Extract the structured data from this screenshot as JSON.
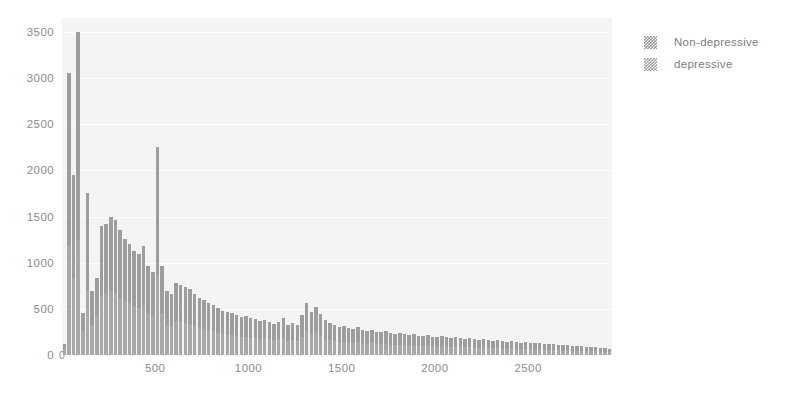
{
  "chart_data": {
    "type": "bar",
    "title": "",
    "subtitle": "",
    "xlabel": "",
    "ylabel": "",
    "xlim": [
      0,
      2950
    ],
    "ylim": [
      0,
      3650
    ],
    "grid": true,
    "legend_position": "right",
    "colors": {
      "series_non_depressive": "#9d9d9d",
      "series_depressive": "#a8a8a8",
      "plot_background": "#f4f4f4",
      "gridline": "#fdfdfd",
      "axis_text": "#8c8c8c",
      "legend_text": "#7d7d7d"
    },
    "y_ticks": [
      0,
      500,
      1000,
      1500,
      2000,
      2500,
      3000,
      3500
    ],
    "y_tick_labels": [
      "0",
      "500",
      "1000",
      "1500",
      "2000",
      "2500",
      "3000",
      "3500"
    ],
    "x_ticks": [
      0,
      500,
      1000,
      1500,
      2000,
      2500
    ],
    "x_tick_labels": [
      "0",
      "500",
      "1000",
      "1500",
      "2000",
      "2500"
    ],
    "legend": [
      {
        "label": "Non-depressive",
        "color": "#9d9d9d"
      },
      {
        "label": "depressive",
        "color": "#a8a8a8"
      }
    ],
    "bin_width": 25,
    "x": [
      12,
      37,
      62,
      87,
      112,
      137,
      162,
      187,
      212,
      237,
      262,
      287,
      312,
      337,
      362,
      387,
      412,
      437,
      462,
      487,
      512,
      537,
      562,
      587,
      612,
      637,
      662,
      687,
      712,
      737,
      762,
      787,
      812,
      837,
      862,
      887,
      912,
      937,
      962,
      987,
      1012,
      1037,
      1062,
      1087,
      1112,
      1137,
      1162,
      1187,
      1212,
      1237,
      1262,
      1287,
      1312,
      1337,
      1362,
      1387,
      1412,
      1437,
      1462,
      1487,
      1512,
      1537,
      1562,
      1587,
      1612,
      1637,
      1662,
      1687,
      1712,
      1737,
      1762,
      1787,
      1812,
      1837,
      1862,
      1887,
      1912,
      1937,
      1962,
      1987,
      2012,
      2037,
      2062,
      2087,
      2112,
      2137,
      2162,
      2187,
      2212,
      2237,
      2262,
      2287,
      2312,
      2337,
      2362,
      2387,
      2412,
      2437,
      2462,
      2487,
      2512,
      2537,
      2562,
      2587,
      2612,
      2637,
      2662,
      2687,
      2712,
      2737,
      2762,
      2787,
      2812,
      2837,
      2862,
      2887,
      2912,
      2937
    ],
    "series": [
      {
        "name": "Non-depressive",
        "values": [
          120,
          3050,
          1950,
          3500,
          450,
          1750,
          690,
          830,
          1400,
          1420,
          1500,
          1460,
          1350,
          1260,
          1200,
          1130,
          1090,
          1180,
          960,
          900,
          2250,
          960,
          690,
          660,
          780,
          760,
          740,
          710,
          660,
          620,
          600,
          560,
          540,
          510,
          480,
          470,
          450,
          430,
          410,
          420,
          400,
          390,
          370,
          380,
          360,
          340,
          360,
          400,
          330,
          350,
          320,
          430,
          560,
          470,
          520,
          440,
          380,
          350,
          330,
          300,
          310,
          290,
          280,
          300,
          270,
          260,
          275,
          250,
          245,
          260,
          235,
          230,
          240,
          225,
          215,
          230,
          210,
          205,
          215,
          200,
          195,
          205,
          190,
          185,
          195,
          180,
          175,
          185,
          170,
          165,
          175,
          160,
          155,
          165,
          150,
          145,
          155,
          140,
          135,
          145,
          130,
          125,
          135,
          120,
          115,
          120,
          110,
          105,
          110,
          100,
          95,
          100,
          90,
          85,
          88,
          80,
          75,
          70
        ]
      },
      {
        "name": "depressive",
        "values": [
          70,
          1180,
          830,
          1250,
          260,
          700,
          330,
          420,
          640,
          660,
          690,
          670,
          620,
          580,
          560,
          530,
          510,
          545,
          450,
          420,
          880,
          450,
          330,
          310,
          365,
          355,
          345,
          335,
          310,
          290,
          280,
          265,
          255,
          240,
          225,
          220,
          212,
          202,
          195,
          198,
          188,
          183,
          175,
          178,
          170,
          160,
          170,
          188,
          155,
          165,
          150,
          200,
          260,
          220,
          245,
          205,
          178,
          165,
          155,
          142,
          146,
          136,
          132,
          142,
          128,
          122,
          130,
          118,
          115,
          122,
          110,
          108,
          113,
          106,
          101,
          108,
          99,
          96,
          101,
          94,
          92,
          96,
          89,
          87,
          92,
          85,
          82,
          87,
          80,
          78,
          82,
          75,
          73,
          78,
          70,
          68,
          73,
          66,
          64,
          68,
          61,
          59,
          63,
          56,
          54,
          56,
          52,
          49,
          52,
          47,
          45,
          47,
          42,
          40,
          41,
          38,
          35,
          33
        ]
      }
    ]
  }
}
